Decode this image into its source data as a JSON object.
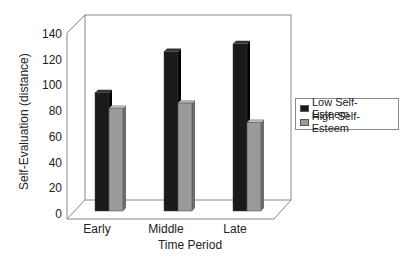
{
  "chart_data": {
    "type": "bar",
    "title": "",
    "xlabel": "Time Period",
    "ylabel": "Self-Evaluation (distance)",
    "categories": [
      "Early",
      "Middle",
      "Late"
    ],
    "series": [
      {
        "name": "Low Self-Esteem",
        "values": [
          92,
          124,
          130
        ],
        "color": "#1a1a1a"
      },
      {
        "name": "High Self-Esteem",
        "values": [
          80,
          84,
          69
        ],
        "color": "#9a9a9a"
      }
    ],
    "ylim": [
      0,
      140
    ],
    "yticks": [
      "0",
      "20",
      "40",
      "60",
      "80",
      "100",
      "120",
      "140"
    ],
    "grid": false,
    "legend_position": "right",
    "style": "3d"
  }
}
